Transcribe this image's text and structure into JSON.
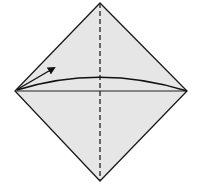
{
  "diagram": {
    "type": "origami-fold-step",
    "colors": {
      "background": "#ffffff",
      "paper_fill": "#e6e6e6",
      "outline": "#1a1a1a",
      "crease": "#222222",
      "arrow": "#111111"
    },
    "square": {
      "top": [
        100,
        3
      ],
      "right": [
        187,
        91
      ],
      "bottom": [
        100,
        181
      ],
      "left": [
        15,
        91
      ]
    },
    "vertical_crease": {
      "style": "valley-dashed",
      "from": [
        100,
        3
      ],
      "to": [
        100,
        181
      ],
      "dash": "5 3"
    },
    "horizontal_line": {
      "style": "solid",
      "from": [
        15,
        91
      ],
      "to": [
        187,
        91
      ]
    },
    "fold_arc": {
      "from": [
        17,
        90
      ],
      "control": [
        100,
        64
      ],
      "to": [
        187,
        91
      ]
    },
    "arrow": {
      "from": [
        18,
        89
      ],
      "to": [
        54,
        68
      ]
    }
  }
}
